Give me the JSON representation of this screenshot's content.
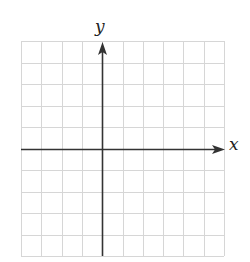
{
  "figure": {
    "type": "blank-coordinate-grid",
    "x_axis_label": "x",
    "y_axis_label": "y",
    "grid": {
      "columns": 10,
      "rows": 10,
      "left_px": 21,
      "top_px": 41,
      "right_px": 224,
      "bottom_px": 256,
      "y_axis_column_index": 4,
      "x_axis_row_index": 5
    },
    "colors": {
      "background": "#ffffff",
      "grid_line": "#d6d6d6",
      "axis": "#333333",
      "label": "#222222"
    }
  }
}
